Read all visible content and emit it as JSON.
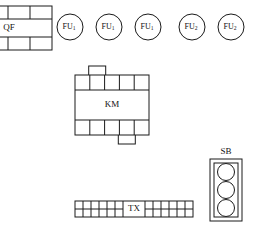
{
  "diagram": {
    "stroke_color": "#1a1a1a",
    "background_color": "#ffffff",
    "devices": {
      "breaker": {
        "label": "QF",
        "name": "circuit-breaker",
        "x": -14,
        "y": 6,
        "w": 66,
        "h": 44,
        "row_heights": [
          13,
          18,
          13
        ],
        "top_cells": 3,
        "bottom_cells": 3
      },
      "contactor": {
        "label": "KM",
        "name": "contactor",
        "x": 75,
        "y": 75,
        "w": 74,
        "h": 60,
        "top_row_h": 15,
        "bottom_row_h": 15,
        "top_cells": 5,
        "bottom_cells": 5,
        "top_tab": {
          "cell_index": 1,
          "w": 17,
          "h": 9
        },
        "bottom_tab": {
          "cell_index": 3,
          "w": 17,
          "h": 9
        }
      },
      "terminal_strip": {
        "label": "TX",
        "name": "terminal-strip",
        "x": 75,
        "y": 201,
        "w": 118,
        "h": 16,
        "left_cells": 6,
        "right_cells": 6,
        "label_w": 22
      },
      "pushbutton_station": {
        "label": "SB",
        "name": "pushbutton-station",
        "x": 210,
        "y": 159,
        "w": 32,
        "h": 62,
        "inset": 4,
        "buttons": 3
      }
    },
    "fuses": [
      {
        "label": "FU",
        "subscript": "1",
        "cx": 70,
        "cy": 27,
        "r": 13
      },
      {
        "label": "FU",
        "subscript": "1",
        "cx": 109,
        "cy": 27,
        "r": 13
      },
      {
        "label": "FU",
        "subscript": "1",
        "cx": 148,
        "cy": 27,
        "r": 13
      },
      {
        "label": "FU",
        "subscript": "2",
        "cx": 192,
        "cy": 27,
        "r": 13
      },
      {
        "label": "FU",
        "subscript": "2",
        "cx": 231,
        "cy": 27,
        "r": 13
      }
    ]
  }
}
